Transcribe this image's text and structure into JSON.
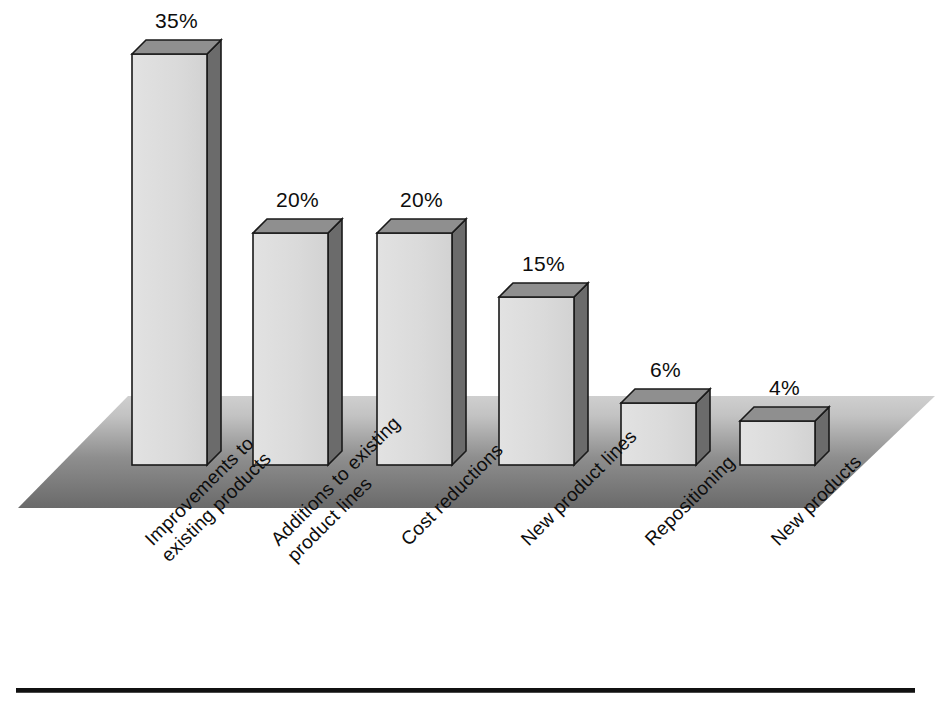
{
  "chart_data": {
    "type": "bar",
    "title": "",
    "subtitle": "",
    "xlabel": "",
    "ylabel": "",
    "grid": false,
    "legend": "none",
    "style": "3d-bar",
    "ylim": [
      0,
      40
    ],
    "categories": [
      "Improvements to existing products",
      "Additions to existing product lines",
      "Cost reductions",
      "New product lines",
      "Repositioning",
      "New products"
    ],
    "values": [
      35,
      20,
      20,
      15,
      6,
      4
    ],
    "value_labels": [
      "35%",
      "20%",
      "20%",
      "15%",
      "6%",
      "4%"
    ],
    "category_lines": [
      [
        "Improvements to",
        "existing products"
      ],
      [
        "Additions to existing",
        "product lines"
      ],
      [
        "Cost reductions",
        ""
      ],
      [
        "New product lines",
        ""
      ],
      [
        "Repositioning",
        ""
      ],
      [
        "New products",
        ""
      ]
    ]
  },
  "colors": {
    "bar_front": "#d9d9d9",
    "bar_top": "#8f8f8f",
    "bar_side": "#6b6b6b",
    "bar_outline": "#1a1a1a",
    "ground_light": "#c3c3c3",
    "ground_dark": "#6e6e6e",
    "text": "#0d0d0d",
    "rule": "#111111",
    "background": "#ffffff"
  },
  "geometry": {
    "baseline_y": 465,
    "depth_x": 14,
    "depth_y": 14,
    "bar_width": 75,
    "bar_left_x": [
      132,
      253,
      377,
      499,
      621,
      740
    ],
    "bar_top_y": [
      54,
      233,
      233,
      297,
      403,
      421
    ]
  },
  "footer": {
    "rule_visible": true
  }
}
